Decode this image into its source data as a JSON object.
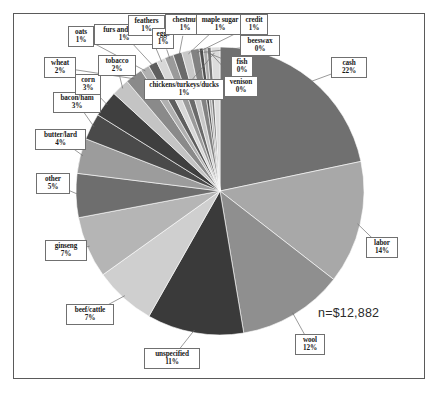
{
  "figure": {
    "annotation": "n=$12,882",
    "border_color": "#5a5a5a",
    "background": "#ffffff"
  },
  "chart_data": {
    "type": "pie",
    "title": "",
    "xlabel": "",
    "ylabel": "",
    "annotation": "n=$12,882",
    "total_label": "n=$12,882",
    "legend": "none",
    "start_angle_deg": 0,
    "direction": "clockwise",
    "categories": [
      "cash",
      "labor",
      "wool",
      "unspecified",
      "beef/cattle",
      "ginseng",
      "other",
      "butter/lard",
      "bacon/ham",
      "corn",
      "tobacco",
      "wheat",
      "oats",
      "furs and skins",
      "feathers",
      "eggs",
      "chestnut",
      "maple sugar",
      "credit",
      "beeswax",
      "fish",
      "venison",
      "chickens/turkeys/ducks"
    ],
    "values": [
      22,
      14,
      12,
      11,
      7,
      7,
      5,
      4,
      3,
      3,
      2,
      2,
      1,
      1,
      1,
      1,
      1,
      1,
      1,
      0,
      0,
      0,
      1
    ],
    "value_labels": [
      "22%",
      "14%",
      "12%",
      "11%",
      "7%",
      "7%",
      "5%",
      "4%",
      "3%",
      "3%",
      "2%",
      "2%",
      "1%",
      "1%",
      "1%",
      "1%",
      "1%",
      "1%",
      "1%",
      "0%",
      "0%",
      "0%",
      "1%"
    ],
    "slice_colors": [
      "#707070",
      "#a8a8a8",
      "#8f8f8f",
      "#3a3a3a",
      "#cfcfcf",
      "#b5b5b5",
      "#6e6e6e",
      "#9c9c9c",
      "#4a4a4a",
      "#3f3f3f",
      "#c4c4c4",
      "#8a8a8a",
      "#b0b0b0",
      "#5e5e5e",
      "#d8d8d8",
      "#9a9a9a",
      "#6a6a6a",
      "#c8c8c8",
      "#828282",
      "#4f4f4f",
      "#ababab",
      "#757575",
      "#dcdcdc"
    ],
    "labels": [
      {
        "name": "cash",
        "value": "22%"
      },
      {
        "name": "labor",
        "value": "14%"
      },
      {
        "name": "wool",
        "value": "12%"
      },
      {
        "name": "unspecified",
        "value": "11%"
      },
      {
        "name": "beef/cattle",
        "value": "7%"
      },
      {
        "name": "ginseng",
        "value": "7%"
      },
      {
        "name": "other",
        "value": "5%"
      },
      {
        "name": "butter/lard",
        "value": "4%"
      },
      {
        "name": "bacon/ham",
        "value": "3%"
      },
      {
        "name": "corn",
        "value": "3%"
      },
      {
        "name": "tobacco",
        "value": "2%"
      },
      {
        "name": "wheat",
        "value": "2%"
      },
      {
        "name": "oats",
        "value": "1%"
      },
      {
        "name": "furs and skins",
        "value": "1%"
      },
      {
        "name": "feathers",
        "value": "1%"
      },
      {
        "name": "eggs",
        "value": "1%"
      },
      {
        "name": "chestnut",
        "value": "1%"
      },
      {
        "name": "maple sugar",
        "value": "1%"
      },
      {
        "name": "credit",
        "value": "1%"
      },
      {
        "name": "beeswax",
        "value": "0%"
      },
      {
        "name": "fish",
        "value": "0%"
      },
      {
        "name": "venison",
        "value": "0%"
      },
      {
        "name": "chickens/turkeys/ducks",
        "value": "1%"
      }
    ]
  }
}
